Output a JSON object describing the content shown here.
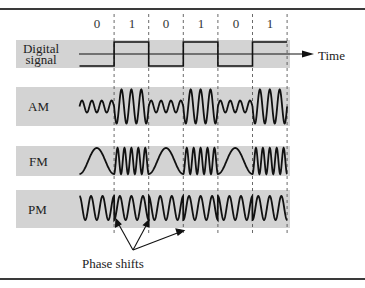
{
  "figure": {
    "bits": [
      "0",
      "1",
      "0",
      "1",
      "0",
      "1"
    ],
    "time_label": "Time",
    "rows": [
      {
        "id": "digital",
        "label_lines": [
          "Digital",
          "signal"
        ]
      },
      {
        "id": "am",
        "label": "AM"
      },
      {
        "id": "fm",
        "label": "FM"
      },
      {
        "id": "pm",
        "label": "PM"
      }
    ],
    "annotation": "Phase shifts",
    "colors": {
      "band": "#d3d3d3",
      "line": "#1a1a1a",
      "rule": "#3a3a3a"
    }
  },
  "chart_data": {
    "type": "diagram",
    "bit_sequence": [
      0,
      1,
      0,
      1,
      0,
      1
    ],
    "signals": [
      {
        "name": "Digital signal",
        "kind": "square wave",
        "levels": [
          0,
          1,
          0,
          1,
          0,
          1
        ]
      },
      {
        "name": "AM",
        "kind": "amplitude modulation",
        "amplitude_low_bit": "small",
        "amplitude_high_bit": "large"
      },
      {
        "name": "FM",
        "kind": "frequency modulation",
        "frequency_low_bit": "low",
        "frequency_high_bit": "high"
      },
      {
        "name": "PM",
        "kind": "phase modulation",
        "phase_shift_at_transitions": true
      }
    ],
    "annotations": [
      "Time",
      "Phase shifts"
    ]
  }
}
